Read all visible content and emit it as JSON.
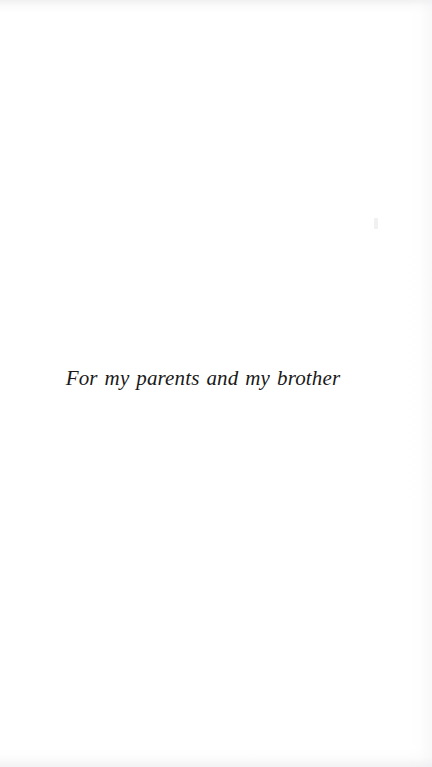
{
  "page": {
    "type": "book-dedication-page",
    "background_color": "#ffffff",
    "ink_color": "#1a1a1a"
  },
  "dedication": {
    "text": "For my parents and my brother"
  }
}
